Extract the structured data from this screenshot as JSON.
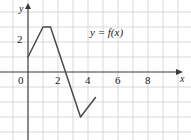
{
  "figure": {
    "kind": "line-graph",
    "background": "#ffffff",
    "grid_color": "#cfcfcf",
    "axis_color": "#3a3a3a",
    "curve_color": "#4a4a4a"
  },
  "axes": {
    "x_name": "x",
    "y_name": "y",
    "x_ticks": [
      "0",
      "2",
      "4",
      "6",
      "8"
    ],
    "x_tick_values": [
      0,
      2,
      4,
      6,
      8
    ],
    "y_ticks": [
      "2"
    ],
    "y_tick_values": [
      2
    ],
    "x_range": [
      -2,
      10
    ],
    "y_range": [
      -4,
      4.5
    ],
    "grid": "on",
    "grid_step_x": 2,
    "grid_step_y": 1
  },
  "annotations": {
    "function_label": "y = f(x)",
    "function_label_y": "y",
    "function_label_eq": "=",
    "function_label_f": "f",
    "function_label_arg": "(x)"
  },
  "chart_data": {
    "type": "line",
    "title": "",
    "xlabel": "x",
    "ylabel": "y",
    "xlim": [
      -2,
      10
    ],
    "ylim": [
      -4,
      4.5
    ],
    "grid": "on",
    "legend": "none",
    "series": [
      {
        "name": "y = f(x)",
        "x": [
          0,
          2,
          3,
          7,
          9
        ],
        "y": [
          1,
          3,
          3,
          -3,
          -1.7
        ],
        "points": [
          [
            0,
            1
          ],
          [
            2,
            3
          ],
          [
            3,
            3
          ],
          [
            7,
            -3
          ],
          [
            9,
            -1.7
          ]
        ]
      }
    ],
    "annotations": [
      {
        "text": "y = f(x)",
        "x": 4.2,
        "y": 2.4
      }
    ]
  }
}
